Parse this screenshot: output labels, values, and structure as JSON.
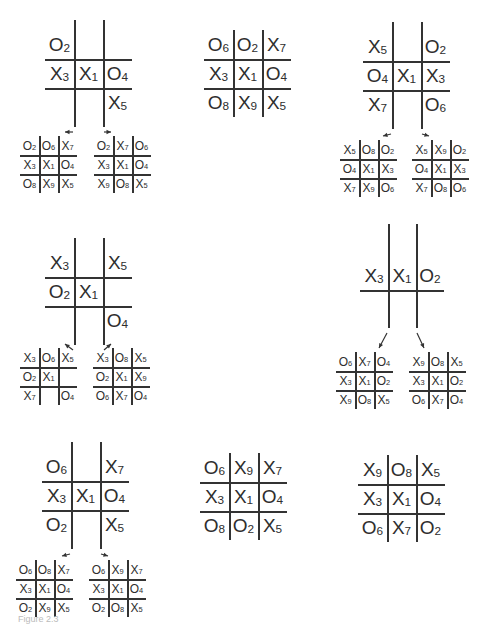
{
  "figure": {
    "boards": [
      {
        "id": "A",
        "size": "large",
        "grid_style": "open",
        "cells": [
          [
            "O2",
            "",
            ""
          ],
          [
            "X3",
            "X1",
            "O4"
          ],
          [
            "",
            "",
            "X5"
          ]
        ],
        "children": [
          {
            "id": "A1",
            "cells": [
              [
                "O2",
                "O6",
                "X7"
              ],
              [
                "X3",
                "X1",
                "O4"
              ],
              [
                "O8",
                "X9",
                "X5"
              ]
            ]
          },
          {
            "id": "A2",
            "cells": [
              [
                "O2",
                "X7",
                "O6"
              ],
              [
                "X3",
                "X1",
                "O4"
              ],
              [
                "X9",
                "O8",
                "X5"
              ]
            ]
          }
        ]
      },
      {
        "id": "B",
        "size": "large",
        "grid_style": "closed",
        "cells": [
          [
            "O6",
            "O2",
            "X7"
          ],
          [
            "X3",
            "X1",
            "O4"
          ],
          [
            "O8",
            "X9",
            "X5"
          ]
        ],
        "children": []
      },
      {
        "id": "C",
        "size": "large",
        "grid_style": "open",
        "cells": [
          [
            "X5",
            "",
            "O2"
          ],
          [
            "O4",
            "X1",
            "X3"
          ],
          [
            "X7",
            "",
            "O6"
          ]
        ],
        "children": [
          {
            "id": "C1",
            "cells": [
              [
                "X5",
                "O8",
                "O2"
              ],
              [
                "O4",
                "X1",
                "X3"
              ],
              [
                "X7",
                "X9",
                "O6"
              ]
            ]
          },
          {
            "id": "C2",
            "cells": [
              [
                "X5",
                "X9",
                "O2"
              ],
              [
                "O4",
                "X1",
                "X3"
              ],
              [
                "X7",
                "O8",
                "O6"
              ]
            ]
          }
        ]
      },
      {
        "id": "D",
        "size": "large",
        "grid_style": "open",
        "cells": [
          [
            "X3",
            "",
            "X5"
          ],
          [
            "O2",
            "X1",
            ""
          ],
          [
            "",
            "",
            "O4"
          ]
        ],
        "children": [
          {
            "id": "D1",
            "cells": [
              [
                "X3",
                "O6",
                "X5"
              ],
              [
                "O2",
                "X1",
                ""
              ],
              [
                "X7",
                "",
                "O4"
              ]
            ]
          },
          {
            "id": "D2",
            "cells": [
              [
                "X3",
                "O8",
                "X5"
              ],
              [
                "O2",
                "X1",
                "X9"
              ],
              [
                "O6",
                "X7",
                "O4"
              ]
            ]
          }
        ]
      },
      {
        "id": "E",
        "size": "large",
        "grid_style": "open",
        "cells": [
          [
            "",
            "",
            ""
          ],
          [
            "X3",
            "X1",
            "O2"
          ],
          [
            "",
            "",
            ""
          ]
        ],
        "children": [
          {
            "id": "E1",
            "cells": [
              [
                "O6",
                "X7",
                "O4"
              ],
              [
                "X3",
                "X1",
                "O2"
              ],
              [
                "X9",
                "O8",
                "X5"
              ]
            ]
          },
          {
            "id": "E2",
            "cells": [
              [
                "X9",
                "O8",
                "X5"
              ],
              [
                "X3",
                "X1",
                "O2"
              ],
              [
                "O6",
                "X7",
                "O4"
              ]
            ]
          }
        ]
      },
      {
        "id": "F",
        "size": "large",
        "grid_style": "open",
        "cells": [
          [
            "O6",
            "",
            "X7"
          ],
          [
            "X3",
            "X1",
            "O4"
          ],
          [
            "O2",
            "",
            "X5"
          ]
        ],
        "children": [
          {
            "id": "F1",
            "cells": [
              [
                "O6",
                "O8",
                "X7"
              ],
              [
                "X3",
                "X1",
                "O4"
              ],
              [
                "O2",
                "X9",
                "X5"
              ]
            ]
          },
          {
            "id": "F2",
            "cells": [
              [
                "O6",
                "X9",
                "X7"
              ],
              [
                "X3",
                "X1",
                "O4"
              ],
              [
                "O2",
                "O8",
                "X5"
              ]
            ]
          }
        ]
      },
      {
        "id": "G",
        "size": "large",
        "grid_style": "closed",
        "cells": [
          [
            "O6",
            "X9",
            "X7"
          ],
          [
            "X3",
            "X1",
            "O4"
          ],
          [
            "O8",
            "O2",
            "X5"
          ]
        ],
        "children": []
      },
      {
        "id": "H",
        "size": "large",
        "grid_style": "closed",
        "cells": [
          [
            "X9",
            "O8",
            "X5"
          ],
          [
            "X3",
            "X1",
            "O4"
          ],
          [
            "O6",
            "X7",
            "O2"
          ]
        ],
        "children": []
      }
    ],
    "caption": "Figure 2.3"
  }
}
